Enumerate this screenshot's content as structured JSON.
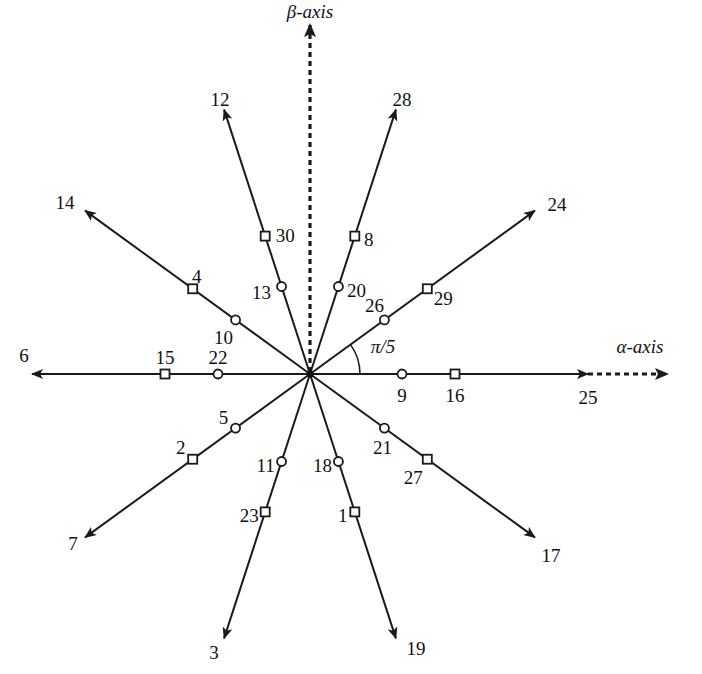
{
  "diagram": {
    "title": "",
    "center": {
      "x": 310,
      "y": 374
    },
    "angle_label": "π/5",
    "axes": {
      "alpha": {
        "label": "α-axis",
        "style": "dashed"
      },
      "beta": {
        "label": "β-axis",
        "style": "dashed"
      }
    },
    "rays": [
      {
        "angle_deg": 0,
        "tip_label": "25",
        "square_label": "16",
        "circle_label": "9"
      },
      {
        "angle_deg": 36,
        "tip_label": "24",
        "square_label": "29",
        "circle_label": "26"
      },
      {
        "angle_deg": 72,
        "tip_label": "28",
        "square_label": "8",
        "circle_label": "20"
      },
      {
        "angle_deg": 108,
        "tip_label": "12",
        "square_label": "30",
        "circle_label": "13"
      },
      {
        "angle_deg": 144,
        "tip_label": "14",
        "square_label": "4",
        "circle_label": "10"
      },
      {
        "angle_deg": 180,
        "tip_label": "6",
        "square_label": "15",
        "circle_label": "22"
      },
      {
        "angle_deg": 216,
        "tip_label": "7",
        "square_label": "2",
        "circle_label": "5"
      },
      {
        "angle_deg": 252,
        "tip_label": "3",
        "square_label": "23",
        "circle_label": "11"
      },
      {
        "angle_deg": 288,
        "tip_label": "19",
        "square_label": "1",
        "circle_label": "18"
      },
      {
        "angle_deg": 324,
        "tip_label": "17",
        "square_label": "27",
        "circle_label": "21"
      }
    ],
    "legend": {
      "square_marker": "square marker (outer vector)",
      "circle_marker": "circle marker (inner vector)"
    }
  }
}
